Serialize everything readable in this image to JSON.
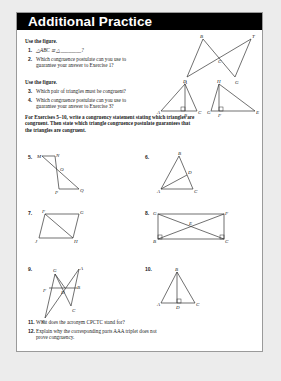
{
  "header": {
    "title": "Additional Practice"
  },
  "section1": {
    "instruction": "Use the figure.",
    "items": [
      {
        "num": "1.",
        "text": "△ABC ≅ △________?"
      },
      {
        "num": "2.",
        "line1": "Which congruence postulate can you use to",
        "line2": "guarantee your answer to Exercise 1?"
      }
    ],
    "figure_labels": [
      "B",
      "T",
      "C",
      "A",
      "G"
    ]
  },
  "section2": {
    "instruction": "Use the figure.",
    "items": [
      {
        "num": "3.",
        "text": "Which pair of triangles must be congruent?"
      },
      {
        "num": "4.",
        "line1": "Which congruence postulate can you use to",
        "line2": "guarantee your answer to Exercise 3?"
      }
    ],
    "figure_labels": [
      "D",
      "H",
      "A",
      "B",
      "C",
      "G",
      "F",
      "E"
    ]
  },
  "section3": {
    "line1": "For Exercises 5–10, write a congruency statement stating which triangles are",
    "line2": "congruent.  Then state which triangle congruence postulate guarantees that",
    "line3": "the triangles are congruent."
  },
  "figures": [
    {
      "num": "5.",
      "labels": [
        "M",
        "N",
        "O",
        "P",
        "Q"
      ]
    },
    {
      "num": "6.",
      "labels": [
        "B",
        "D",
        "A",
        "C"
      ]
    },
    {
      "num": "7.",
      "labels": [
        "F",
        "G",
        "J",
        "H"
      ]
    },
    {
      "num": "8.",
      "labels": [
        "G",
        "F",
        "E",
        "B",
        "C"
      ]
    },
    {
      "num": "9.",
      "labels": [
        "G",
        "A",
        "F",
        "D",
        "B",
        "C",
        "E"
      ]
    },
    {
      "num": "10.",
      "labels": [
        "B",
        "A",
        "D",
        "C"
      ]
    }
  ],
  "section4": {
    "items": [
      {
        "num": "11.",
        "text": "What does the acronym CPCTC stand for?"
      },
      {
        "num": "12.",
        "line1": "Explain why the corresponding parts AAA triplet does not",
        "line2": "prove congruency."
      }
    ]
  }
}
